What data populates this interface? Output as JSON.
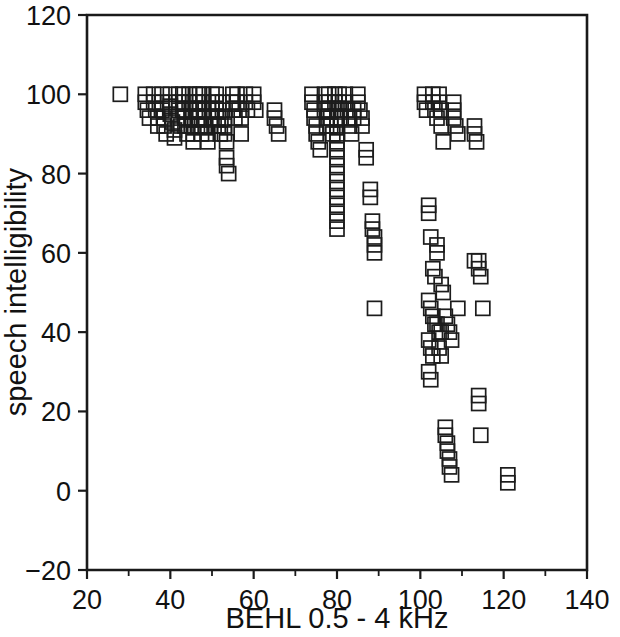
{
  "chart_data": {
    "type": "scatter",
    "title": "",
    "xlabel": "BEHL 0.5 - 4 kHz",
    "ylabel": "speech intelligibility",
    "xlim": [
      20,
      140
    ],
    "ylim": [
      -20,
      120
    ],
    "xticks": [
      20,
      40,
      60,
      80,
      100,
      120,
      140
    ],
    "xtick_labels": [
      "20",
      "40",
      "60",
      "80",
      "100",
      "120",
      "140"
    ],
    "yticks": [
      -20,
      0,
      20,
      40,
      60,
      80,
      100,
      120
    ],
    "ytick_labels": [
      "-20",
      "0",
      "20",
      "40",
      "60",
      "80",
      "100",
      "120"
    ],
    "x_minor_step": 10,
    "grid": false,
    "legend": null,
    "marker": "open-square",
    "marker_color": "#1c1c1c",
    "marker_size": 14,
    "series": [
      {
        "name": "subjects",
        "points": [
          [
            28,
            100
          ],
          [
            34,
            100
          ],
          [
            34,
            98
          ],
          [
            34.5,
            96
          ],
          [
            35,
            94
          ],
          [
            36,
            100
          ],
          [
            36,
            98
          ],
          [
            36.5,
            96
          ],
          [
            37,
            94
          ],
          [
            37,
            92
          ],
          [
            38,
            100
          ],
          [
            38,
            98
          ],
          [
            38,
            96
          ],
          [
            38.5,
            94
          ],
          [
            38.5,
            92
          ],
          [
            39,
            90
          ],
          [
            40,
            100
          ],
          [
            40,
            98
          ],
          [
            40,
            97
          ],
          [
            40,
            95
          ],
          [
            40.5,
            93
          ],
          [
            41,
            91
          ],
          [
            41,
            89
          ],
          [
            42,
            100
          ],
          [
            42,
            98
          ],
          [
            42,
            96
          ],
          [
            42,
            94
          ],
          [
            42.5,
            92
          ],
          [
            43,
            100
          ],
          [
            43,
            98
          ],
          [
            43,
            96
          ],
          [
            43.5,
            94
          ],
          [
            43.5,
            92
          ],
          [
            44,
            90
          ],
          [
            44.5,
            100
          ],
          [
            44.5,
            98
          ],
          [
            45,
            96
          ],
          [
            45,
            94
          ],
          [
            45,
            92
          ],
          [
            45.5,
            90
          ],
          [
            45.5,
            88
          ],
          [
            46,
            100
          ],
          [
            46,
            98
          ],
          [
            46,
            96
          ],
          [
            46.5,
            94
          ],
          [
            46.5,
            92
          ],
          [
            47,
            100
          ],
          [
            47,
            98
          ],
          [
            47,
            96
          ],
          [
            47,
            94
          ],
          [
            47.5,
            92
          ],
          [
            47.5,
            90
          ],
          [
            48,
            100
          ],
          [
            48,
            98
          ],
          [
            48,
            96
          ],
          [
            48,
            94
          ],
          [
            48.5,
            92
          ],
          [
            49,
            90
          ],
          [
            49,
            88
          ],
          [
            50,
            100
          ],
          [
            50,
            98
          ],
          [
            50,
            96
          ],
          [
            50,
            94
          ],
          [
            50.5,
            92
          ],
          [
            51,
            100
          ],
          [
            51,
            98
          ],
          [
            51,
            96
          ],
          [
            51.5,
            94
          ],
          [
            51.5,
            92
          ],
          [
            52,
            90
          ],
          [
            52.5,
            98
          ],
          [
            52.5,
            96
          ],
          [
            53,
            94
          ],
          [
            53,
            92
          ],
          [
            53,
            90
          ],
          [
            53.5,
            88
          ],
          [
            53.5,
            84
          ],
          [
            53.5,
            82
          ],
          [
            54,
            80
          ],
          [
            55,
            100
          ],
          [
            55,
            98
          ],
          [
            55,
            96
          ],
          [
            55.5,
            94
          ],
          [
            56,
            100
          ],
          [
            56,
            98
          ],
          [
            56.5,
            96
          ],
          [
            57,
            94
          ],
          [
            57,
            90
          ],
          [
            58,
            100
          ],
          [
            58,
            98
          ],
          [
            58.5,
            96
          ],
          [
            60,
            100
          ],
          [
            60,
            98
          ],
          [
            60.5,
            96
          ],
          [
            65,
            96
          ],
          [
            65,
            94
          ],
          [
            65.5,
            92
          ],
          [
            66,
            90
          ],
          [
            74,
            100
          ],
          [
            74,
            98
          ],
          [
            74.5,
            96
          ],
          [
            74.5,
            94
          ],
          [
            75,
            92
          ],
          [
            75,
            90
          ],
          [
            75.5,
            88
          ],
          [
            76,
            86
          ],
          [
            77,
            100
          ],
          [
            77,
            98
          ],
          [
            77,
            96
          ],
          [
            77.5,
            94
          ],
          [
            77.5,
            92
          ],
          [
            78,
            100
          ],
          [
            78,
            98
          ],
          [
            78,
            96
          ],
          [
            78.5,
            94
          ],
          [
            78.5,
            92
          ],
          [
            79,
            90
          ],
          [
            79.5,
            100
          ],
          [
            79.5,
            98
          ],
          [
            80,
            96
          ],
          [
            80,
            94
          ],
          [
            80,
            92
          ],
          [
            80,
            90
          ],
          [
            80,
            88
          ],
          [
            80,
            86
          ],
          [
            80,
            84
          ],
          [
            80,
            82
          ],
          [
            80,
            80
          ],
          [
            80,
            78
          ],
          [
            80,
            76
          ],
          [
            80,
            74
          ],
          [
            80,
            72
          ],
          [
            80,
            70
          ],
          [
            80,
            68
          ],
          [
            80,
            66
          ],
          [
            80.5,
            100
          ],
          [
            80.5,
            98
          ],
          [
            81,
            96
          ],
          [
            81,
            94
          ],
          [
            82,
            100
          ],
          [
            82,
            98
          ],
          [
            82.5,
            96
          ],
          [
            83,
            94
          ],
          [
            83,
            92
          ],
          [
            83.5,
            90
          ],
          [
            84,
            96
          ],
          [
            84,
            94
          ],
          [
            85,
            100
          ],
          [
            85,
            98
          ],
          [
            85.5,
            96
          ],
          [
            86,
            94
          ],
          [
            86,
            92
          ],
          [
            87,
            86
          ],
          [
            87,
            84
          ],
          [
            88,
            76
          ],
          [
            88,
            74
          ],
          [
            88.5,
            68
          ],
          [
            88.5,
            66
          ],
          [
            89,
            64
          ],
          [
            89,
            62
          ],
          [
            89,
            60
          ],
          [
            89,
            46
          ],
          [
            101,
            100
          ],
          [
            101,
            98
          ],
          [
            101.5,
            96
          ],
          [
            103,
            100
          ],
          [
            103,
            98
          ],
          [
            103.5,
            96
          ],
          [
            104,
            94
          ],
          [
            104.5,
            100
          ],
          [
            104.5,
            98
          ],
          [
            105,
            96
          ],
          [
            105,
            92
          ],
          [
            105.5,
            88
          ],
          [
            108,
            98
          ],
          [
            108,
            96
          ],
          [
            108,
            94
          ],
          [
            108.5,
            92
          ],
          [
            109,
            90
          ],
          [
            102,
            72
          ],
          [
            102,
            70
          ],
          [
            102.5,
            64
          ],
          [
            104,
            62
          ],
          [
            104,
            60
          ],
          [
            103,
            56
          ],
          [
            103.5,
            54
          ],
          [
            105,
            52
          ],
          [
            105.5,
            50
          ],
          [
            102,
            48
          ],
          [
            102.5,
            46
          ],
          [
            103,
            44
          ],
          [
            103.5,
            42
          ],
          [
            104,
            42
          ],
          [
            104.5,
            40
          ],
          [
            105,
            40
          ],
          [
            102,
            38
          ],
          [
            102.5,
            36
          ],
          [
            103,
            34
          ],
          [
            104.5,
            36
          ],
          [
            105,
            34
          ],
          [
            106,
            44
          ],
          [
            106.5,
            42
          ],
          [
            107,
            40
          ],
          [
            107.5,
            38
          ],
          [
            102,
            30
          ],
          [
            102.5,
            28
          ],
          [
            109,
            46
          ],
          [
            113,
            92
          ],
          [
            113,
            90
          ],
          [
            113.5,
            88
          ],
          [
            113,
            58
          ],
          [
            114,
            58
          ],
          [
            114,
            56
          ],
          [
            114.5,
            54
          ],
          [
            115,
            46
          ],
          [
            106,
            16
          ],
          [
            106,
            14
          ],
          [
            106.5,
            12
          ],
          [
            106.5,
            10
          ],
          [
            107,
            8
          ],
          [
            107,
            6
          ],
          [
            107.5,
            4
          ],
          [
            114,
            24
          ],
          [
            114,
            22
          ],
          [
            114.5,
            14
          ],
          [
            121,
            4
          ],
          [
            121,
            2
          ]
        ]
      }
    ]
  },
  "axis": {
    "x_title": "BEHL 0.5 - 4 kHz",
    "y_title": "speech intelligibility"
  }
}
